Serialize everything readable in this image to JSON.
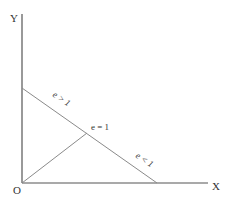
{
  "diagram": {
    "axes": {
      "y_label": "Y",
      "x_label": "X",
      "origin_label": "O"
    },
    "lines": {
      "demand_line": "downward-sloping straight line",
      "ray_from_origin": "ray from origin to midpoint"
    },
    "regions": {
      "upper": "e > 1",
      "midpoint": "e = 1",
      "lower": "e < 1"
    },
    "colors": {
      "axis": "#555555",
      "line": "#8a8a8a",
      "text": "#333333"
    }
  }
}
